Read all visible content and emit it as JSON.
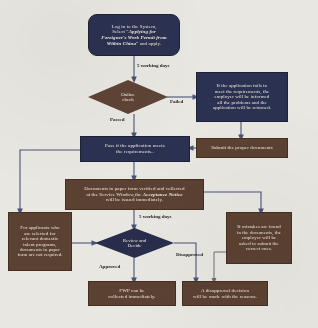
{
  "diagram": {
    "type": "flowchart",
    "colors": {
      "navy": "#2b3150",
      "brown": "#5b4132",
      "connector": "#4a5275",
      "background": "#e9e7e2",
      "node_text": "#efe9dd",
      "label_text": "#1b1b1b"
    },
    "nodes": [
      {
        "id": "start",
        "shape": "rounded-rectangle",
        "color": "navy",
        "text_plain": "Log in to the System, Select \"Applying for Foreigner's Work Permit from Within China\" and apply.",
        "line1": "Log in to the System,",
        "line2_prefix": "Select “",
        "line2_em": "Applying for",
        "line3_em": "Foreigner's Work Permit from",
        "line4_em": "Within China",
        "line4_suffix": "” and apply."
      },
      {
        "id": "online-check",
        "shape": "diamond",
        "color": "brown",
        "line1": "Online",
        "line2": "check",
        "text_plain": "Online check"
      },
      {
        "id": "application-fails",
        "shape": "rectangle",
        "color": "navy",
        "text_plain": "If the application fails to meet the requirements, the employer will be informed all the problems and the application will be returned.",
        "line1": "If the application fails to",
        "line2": "meet the requirements, the",
        "line3": "employer will be informed",
        "line4": "all the problems and the",
        "line5": "application will be returned."
      },
      {
        "id": "pass-requirements",
        "shape": "rectangle",
        "color": "navy",
        "text_plain": "Pass if the application meets the requirements..",
        "line1": "Pass if the application meets",
        "line2": "the requirements.."
      },
      {
        "id": "submit-documents",
        "shape": "rectangle",
        "color": "brown",
        "text_plain": "Submit the proper documents",
        "line1": "Submit the proper documents"
      },
      {
        "id": "paper-documents",
        "shape": "rectangle",
        "color": "brown",
        "text_plain": "Documents in paper form verified and collected at the Service Window,the Acceptance Notice will be issued immediately.",
        "line1": "Documents in paper form verified and collected",
        "line2_prefix": "at the Service Window,the ",
        "line2_em": "Acceptance Notice",
        "line3": "will be issued immediately."
      },
      {
        "id": "talent-program-exempt",
        "shape": "rectangle",
        "color": "brown",
        "text_plain": "For applicants who are selected for relevant domestic talent programs, documents in paper form are not required.",
        "line1": "For applicants who",
        "line2": "are selected for",
        "line3": "relevant domestic",
        "line4": "talent programs,",
        "line5": "documents in paper",
        "line6": "form are not required."
      },
      {
        "id": "review-decide",
        "shape": "diamond",
        "color": "navy",
        "line1": "Review and",
        "line2": "Decide",
        "text_plain": "Review and Decide"
      },
      {
        "id": "mistakes-found",
        "shape": "rectangle",
        "color": "brown",
        "text_plain": "If mistakes are found in the documents, the employer will be asked to submit the correct ones.",
        "line1": "If mistakes are found",
        "line2": "in the documents, the",
        "line3": "employer will be",
        "line4": "asked to submit the",
        "line5": "correct ones."
      },
      {
        "id": "fwp-collected",
        "shape": "rectangle",
        "color": "brown",
        "text_plain": "FWP can be collected immediately.",
        "line1": "FWP can be",
        "line2": "collected immediately."
      },
      {
        "id": "disapproval-decision",
        "shape": "rectangle",
        "color": "brown",
        "text_plain": "A disapproval decision will be made with the reasons.",
        "line1": "A disapproval decision",
        "line2": "will be made with the reasons."
      }
    ],
    "edge_labels": [
      {
        "id": "days-1",
        "text": "5 working days"
      },
      {
        "id": "failed",
        "text": "Failed"
      },
      {
        "id": "passed",
        "text": "Passed"
      },
      {
        "id": "days-2",
        "text": "5 working days"
      },
      {
        "id": "approved",
        "text": "Approved"
      },
      {
        "id": "disapproved",
        "text": "Disapproved"
      }
    ]
  }
}
